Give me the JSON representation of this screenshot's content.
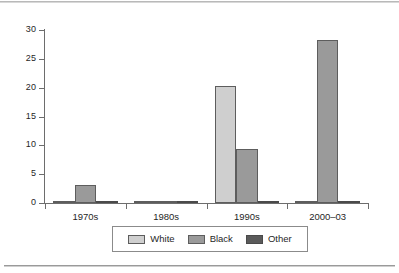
{
  "chart_data": {
    "type": "bar",
    "title": "",
    "subtitle": "",
    "xlabel": "",
    "ylabel": "",
    "categories": [
      "1970s",
      "1980s",
      "1990s",
      "2000–03"
    ],
    "series": [
      {
        "name": "White",
        "color": "#cfcfcf",
        "values": [
          0.2,
          0.1,
          20.3,
          0.3
        ]
      },
      {
        "name": "Black",
        "color": "#9a9a9a",
        "values": [
          3.2,
          0.1,
          9.4,
          28.3
        ]
      },
      {
        "name": "Other",
        "color": "#5a5a5a",
        "values": [
          0.2,
          0.2,
          0.3,
          0.3
        ]
      }
    ],
    "ylim": [
      0,
      30
    ],
    "yticks": [
      0,
      5,
      10,
      15,
      20,
      25,
      30
    ],
    "ytick_labels": [
      "0",
      "5",
      "10",
      "15",
      "20",
      "25",
      "30"
    ],
    "grid": false,
    "legend_position": "bottom",
    "legend_entries": [
      "White",
      "Black",
      "Other"
    ]
  },
  "figure": {
    "has_top_rule": true,
    "has_bottom_rule": true
  }
}
